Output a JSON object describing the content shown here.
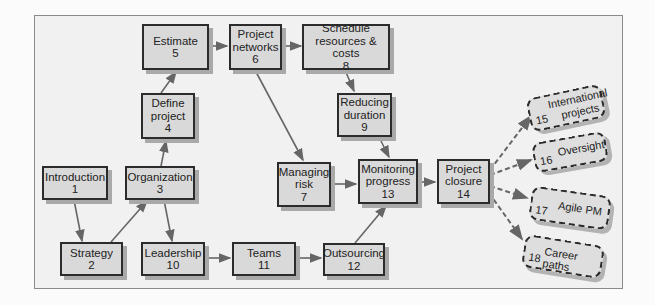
{
  "diagram": {
    "type": "flowchart",
    "nodes": [
      {
        "id": 1,
        "label": "Introduction",
        "num": "1",
        "style": "solid"
      },
      {
        "id": 2,
        "label": "Strategy",
        "num": "2",
        "style": "solid"
      },
      {
        "id": 3,
        "label": "Organization",
        "num": "3",
        "style": "solid"
      },
      {
        "id": 4,
        "label": "Define project",
        "line1": "Define",
        "line2": "project",
        "num": "4",
        "style": "solid"
      },
      {
        "id": 5,
        "label": "Estimate",
        "num": "5",
        "style": "solid"
      },
      {
        "id": 6,
        "label": "Project networks",
        "line1": "Project",
        "line2": "networks",
        "num": "6",
        "style": "solid"
      },
      {
        "id": 7,
        "label": "Managing risk",
        "line1": "Managing",
        "line2": "risk",
        "num": "7",
        "style": "solid"
      },
      {
        "id": 8,
        "label": "Schedule resources & costs",
        "line1": "Schedule",
        "line2": "resources & costs",
        "num": "8",
        "style": "solid"
      },
      {
        "id": 9,
        "label": "Reducing duration",
        "line1": "Reducing",
        "line2": "duration",
        "num": "9",
        "style": "solid"
      },
      {
        "id": 10,
        "label": "Leadership",
        "num": "10",
        "style": "solid"
      },
      {
        "id": 11,
        "label": "Teams",
        "num": "11",
        "style": "solid"
      },
      {
        "id": 12,
        "label": "Outsourcing",
        "num": "12",
        "style": "solid"
      },
      {
        "id": 13,
        "label": "Monitoring progress",
        "line1": "Monitoring",
        "line2": "progress",
        "num": "13",
        "style": "solid"
      },
      {
        "id": 14,
        "label": "Project closure",
        "line1": "Project",
        "line2": "closure",
        "num": "14",
        "style": "solid"
      },
      {
        "id": 15,
        "label": "International projects",
        "line1": "International",
        "line2": "projects",
        "num": "15",
        "style": "dashed"
      },
      {
        "id": 16,
        "label": "Oversight",
        "num": "16",
        "style": "dashed"
      },
      {
        "id": 17,
        "label": "Agile PM",
        "num": "17",
        "style": "dashed"
      },
      {
        "id": 18,
        "label": "Career paths",
        "num": "18",
        "style": "dashed"
      }
    ],
    "edges": [
      {
        "from": 1,
        "to": 2
      },
      {
        "from": 2,
        "to": 3
      },
      {
        "from": 3,
        "to": 4
      },
      {
        "from": 3,
        "to": 10
      },
      {
        "from": 4,
        "to": 5
      },
      {
        "from": 5,
        "to": 6
      },
      {
        "from": 6,
        "to": 8
      },
      {
        "from": 6,
        "to": 7
      },
      {
        "from": 8,
        "to": 9
      },
      {
        "from": 9,
        "to": 13
      },
      {
        "from": 7,
        "to": 13
      },
      {
        "from": 10,
        "to": 11
      },
      {
        "from": 11,
        "to": 12
      },
      {
        "from": 12,
        "to": 13
      },
      {
        "from": 13,
        "to": 14
      },
      {
        "from": 14,
        "to": 15,
        "style": "dashed"
      },
      {
        "from": 14,
        "to": 16,
        "style": "dashed"
      },
      {
        "from": 14,
        "to": 17,
        "style": "dashed"
      },
      {
        "from": 14,
        "to": 18,
        "style": "dashed"
      }
    ],
    "colors": {
      "box_fill": "#d9d9d9",
      "border": "#2b2b2b",
      "arrow": "#666666",
      "frame_bg": "#f1f1f1"
    }
  }
}
